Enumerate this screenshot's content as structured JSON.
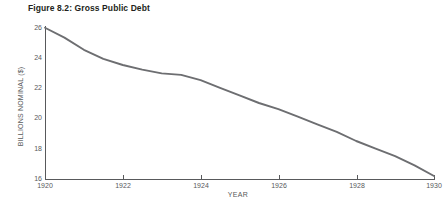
{
  "chart_data": {
    "type": "line",
    "title": "Figure 8.2: Gross Public Debt",
    "xlabel": "YEAR",
    "ylabel": "BILLIONS NOMINAL ($)",
    "xlim": [
      1920,
      1930
    ],
    "ylim": [
      16,
      26
    ],
    "xticks": [
      1920,
      1922,
      1924,
      1926,
      1928,
      1930
    ],
    "xtick_labels": [
      "1920",
      "1922",
      "1924",
      "1926",
      "1928",
      "1930"
    ],
    "yticks": [
      16,
      18,
      20,
      22,
      24,
      26
    ],
    "ytick_labels": [
      "16",
      "18",
      "20",
      "22",
      "24",
      "26"
    ],
    "grid": false,
    "legend": false,
    "line_color": "#6d6e71",
    "axis_color": "#58595b",
    "series": [
      {
        "name": "Gross Public Debt",
        "x": [
          1920,
          1920.5,
          1921,
          1921.5,
          1922,
          1922.5,
          1923,
          1923.5,
          1924,
          1924.5,
          1925,
          1925.5,
          1926,
          1926.5,
          1927,
          1927.5,
          1928,
          1928.5,
          1929,
          1929.5,
          1930
        ],
        "values": [
          25.95,
          25.3,
          24.5,
          23.9,
          23.5,
          23.2,
          22.95,
          22.85,
          22.5,
          22.0,
          21.5,
          21.0,
          20.6,
          20.1,
          19.6,
          19.1,
          18.5,
          18.0,
          17.5,
          16.9,
          16.2
        ]
      }
    ]
  }
}
